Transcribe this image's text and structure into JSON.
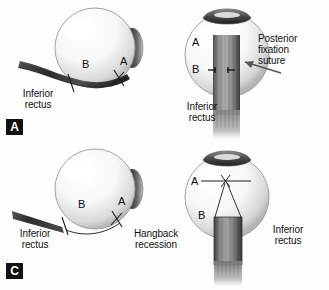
{
  "figure": {
    "width": 329,
    "height": 290,
    "background": "#fdfdfd"
  },
  "colors": {
    "globe_light": "#ffffff",
    "globe_shade": "#c9c9c9",
    "globe_outline": "#8a8a8a",
    "cornea_dark": "#3a3a3a",
    "muscle_dark": "#4a4a4a",
    "muscle_mid": "#8d8d8d",
    "suture_line": "#1a1a1a",
    "text": "#111111",
    "tag_bg": "#121212",
    "tag_text": "#ffffff"
  },
  "panels": [
    {
      "id": "a",
      "tag": "A",
      "view": "lateral",
      "labels": {
        "muscle": "Inferior\nrectus",
        "point_a": "A",
        "point_b": "B"
      }
    },
    {
      "id": "b",
      "tag": "",
      "view": "frontal",
      "labels": {
        "muscle": "Inferior\nrectus",
        "point_a": "A",
        "point_b": "B",
        "callout": "Posterior\nfixation\nsuture"
      }
    },
    {
      "id": "c",
      "tag": "C",
      "view": "lateral",
      "labels": {
        "muscle": "Inferior\nrectus",
        "point_a": "A",
        "point_b": "B",
        "procedure": "Hangback\nrecession"
      }
    },
    {
      "id": "d",
      "tag": "",
      "view": "frontal",
      "labels": {
        "muscle": "Inferior\nrectus",
        "point_a": "A",
        "point_b": "B"
      }
    }
  ]
}
